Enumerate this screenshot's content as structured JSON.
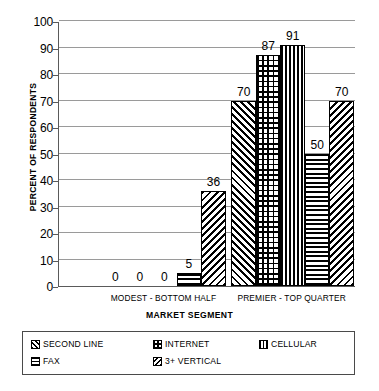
{
  "chart_data": {
    "type": "bar",
    "title": "",
    "xlabel": "MARKET SEGMENT",
    "ylabel": "PERCENT OF RESPONDENTS",
    "categories": [
      "MODEST - BOTTOM HALF",
      "PREMIER - TOP QUARTER"
    ],
    "ylim": [
      0,
      100
    ],
    "ytick_step": 10,
    "yticks": [
      0,
      10,
      20,
      30,
      40,
      50,
      60,
      70,
      80,
      90,
      100
    ],
    "grid": true,
    "grid_axis": "y",
    "legend_position": "bottom",
    "series": [
      {
        "name": "SECOND LINE",
        "pattern": "diagonal-up",
        "values": [
          0,
          70
        ]
      },
      {
        "name": "INTERNET",
        "pattern": "cross-dot",
        "values": [
          0,
          87
        ]
      },
      {
        "name": "CELLULAR",
        "pattern": "vertical-lines",
        "values": [
          0,
          91
        ]
      },
      {
        "name": "FAX",
        "pattern": "horizontal-lines",
        "values": [
          5,
          50
        ]
      },
      {
        "name": "3+ VERTICAL",
        "pattern": "diagonal-down",
        "values": [
          36,
          70
        ]
      }
    ],
    "data_labels": {
      "MODEST - BOTTOM HALF": [
        "0",
        "0",
        "0",
        "5",
        "36"
      ],
      "PREMIER - TOP QUARTER": [
        "70",
        "87",
        "91",
        "50",
        "70"
      ]
    },
    "colors": {
      "ink": "#000000",
      "gridline": "#9a9a9a",
      "axis": "#5a5a5a",
      "background": "#ffffff"
    }
  },
  "legend": {
    "entries": [
      {
        "label": "SECOND LINE"
      },
      {
        "label": "INTERNET"
      },
      {
        "label": "CELLULAR"
      },
      {
        "label": "FAX"
      },
      {
        "label": "3+ VERTICAL"
      }
    ]
  },
  "footer": {
    "caption": ""
  }
}
